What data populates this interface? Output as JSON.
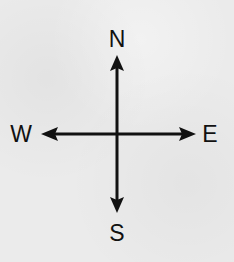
{
  "diagram": {
    "type": "compass-rose",
    "labels": {
      "north": "N",
      "south": "S",
      "west": "W",
      "east": "E"
    },
    "colors": {
      "background": "#ebebeb",
      "ink": "#111111"
    },
    "icons": {
      "north_arrow": "arrow-up-icon",
      "south_arrow": "arrow-down-icon",
      "west_arrow": "arrow-left-icon",
      "east_arrow": "arrow-right-icon"
    }
  }
}
